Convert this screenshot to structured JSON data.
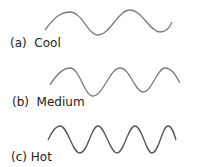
{
  "figure": {
    "panels": [
      {
        "letter": "(a)",
        "label": "(a)  Cool",
        "name": "Cool",
        "cycles": 2
      },
      {
        "letter": "(b)",
        "label": "(b)  Medium",
        "name": "Medium",
        "cycles": 3
      },
      {
        "letter": "(c)",
        "label": "(c) Hot",
        "name": "Hot",
        "cycles": 4
      }
    ],
    "wave_color": "#7a7a7a",
    "text_color": "#222222"
  }
}
